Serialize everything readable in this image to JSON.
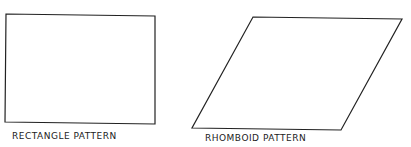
{
  "figures": [
    {
      "name": "rectangle",
      "label": "RECTANGLE PATTERN"
    },
    {
      "name": "rhomboid",
      "label": "RHOMBOID PATTERN"
    }
  ],
  "colors": {
    "stroke": "#222222",
    "background": "#ffffff"
  }
}
